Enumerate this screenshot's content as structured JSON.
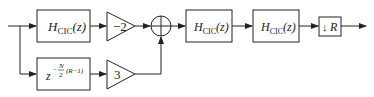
{
  "diagram": {
    "type": "block-diagram",
    "blocks": [
      {
        "id": "cic1",
        "label_main": "H",
        "label_sub": "CIC",
        "label_arg": "(z)"
      },
      {
        "id": "gain_top",
        "label": "−2"
      },
      {
        "id": "delay",
        "label_base": "z",
        "label_exp": "−",
        "label_frac_num": "N",
        "label_frac_den": "2",
        "label_exp_tail": "(R−1)"
      },
      {
        "id": "gain_bottom",
        "label": "3"
      },
      {
        "id": "sum",
        "label": "+"
      },
      {
        "id": "cic2",
        "label_main": "H",
        "label_sub": "CIC",
        "label_arg": "(z)"
      },
      {
        "id": "cic3",
        "label_main": "H",
        "label_sub": "CIC",
        "label_arg": "(z)"
      },
      {
        "id": "decimator",
        "label_arrow": "↓",
        "label_factor": "R"
      }
    ],
    "colors": {
      "stroke": "#222222",
      "background": "#ffffff"
    }
  }
}
